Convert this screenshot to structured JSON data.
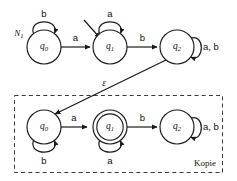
{
  "figure": {
    "type": "finite-automaton-diagram",
    "machine_label": "N",
    "machine_label_sub": "1",
    "copy_caption": "Kopie",
    "background_color": "#ffffff",
    "stroke_color": "#1a1a1a"
  },
  "top_machine": {
    "name": "N1",
    "states": [
      {
        "id": "q0",
        "label": "q",
        "sub": "0",
        "accepting": false,
        "cx": 44,
        "cy": 47,
        "r": 17
      },
      {
        "id": "q1",
        "label": "q",
        "sub": "1",
        "accepting": false,
        "cx": 110,
        "cy": 47,
        "r": 17
      },
      {
        "id": "q2",
        "label": "q",
        "sub": "2",
        "accepting": false,
        "cx": 177,
        "cy": 47,
        "r": 17
      }
    ],
    "start_state": "q1",
    "transitions": [
      {
        "from": "q0",
        "to": "q1",
        "label": "a",
        "kind": "straight"
      },
      {
        "from": "q1",
        "to": "q2",
        "label": "b",
        "kind": "straight"
      },
      {
        "from": "q0",
        "to": "q0",
        "label": "b",
        "kind": "self-loop-top"
      },
      {
        "from": "q1",
        "to": "q1",
        "label": "a",
        "kind": "self-loop-top"
      },
      {
        "from": "q2",
        "to": "q2",
        "label": "a, b",
        "kind": "self-loop-right"
      }
    ]
  },
  "bottom_machine": {
    "name": "Kopie",
    "states": [
      {
        "id": "q0",
        "label": "q",
        "sub": "0",
        "accepting": false,
        "cx": 44,
        "cy": 127,
        "r": 17
      },
      {
        "id": "q1",
        "label": "q",
        "sub": "1",
        "accepting": true,
        "cx": 110,
        "cy": 127,
        "r": 17
      },
      {
        "id": "q2",
        "label": "q",
        "sub": "2",
        "accepting": false,
        "cx": 177,
        "cy": 127,
        "r": 17
      }
    ],
    "transitions": [
      {
        "from": "q0",
        "to": "q1",
        "label": "a",
        "kind": "straight"
      },
      {
        "from": "q1",
        "to": "q2",
        "label": "b",
        "kind": "straight"
      },
      {
        "from": "q0",
        "to": "q0",
        "label": "b",
        "kind": "self-loop-bottom"
      },
      {
        "from": "q1",
        "to": "q1",
        "label": "a",
        "kind": "self-loop-bottom"
      },
      {
        "from": "q2",
        "to": "q2",
        "label": "a, b",
        "kind": "self-loop-right"
      }
    ]
  },
  "cross_transition": {
    "from": "top.q2",
    "to": "bottom.q0",
    "label": "ε",
    "label_x": 104,
    "label_y": 84
  },
  "labels": {
    "top_q0_loop": "b",
    "top_q1_loop": "a",
    "top_q2_loop": "a, b",
    "top_q0_q1": "a",
    "top_q1_q2": "b",
    "bottom_q0_loop": "b",
    "bottom_q1_loop": "a",
    "bottom_q2_loop": "a, b",
    "bottom_q0_q1": "a",
    "bottom_q1_q2": "b",
    "epsilon": "ε",
    "machine_n": "N",
    "machine_n_sub": "1",
    "kopie": "Kopie"
  },
  "state_text": {
    "q": "q",
    "s0": "0",
    "s1": "1",
    "s2": "2"
  }
}
